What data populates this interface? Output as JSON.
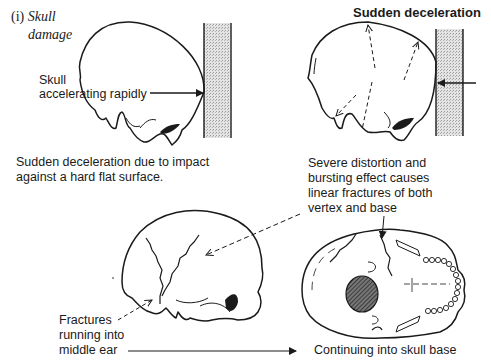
{
  "figure": {
    "section_label": "(i)",
    "title_line1": "Skull",
    "title_line2": "damage"
  },
  "panels": {
    "acceleration": {
      "label_line1": "Skull",
      "label_line2": "accelerating rapidly",
      "caption_line1": "Sudden deceleration due to impact",
      "caption_line2": "against a hard flat surface."
    },
    "deceleration": {
      "heading": "Sudden deceleration",
      "caption_line1": "Severe distortion and",
      "caption_line2": "bursting effect causes",
      "caption_line3": "linear fractures of both",
      "caption_line4": "vertex and base"
    },
    "lateral_fractures": {
      "label_line1": "Fractures",
      "label_line2": "running into",
      "label_line3": "middle ear"
    },
    "skull_base": {
      "label": "Continuing into skull base"
    }
  },
  "colors": {
    "ink": "#1a1a1a",
    "wall_fill": "#c8c8c8",
    "hatch_fill": "#555555"
  }
}
